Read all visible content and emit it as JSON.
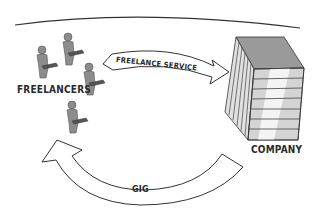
{
  "diagram": {
    "type": "flow",
    "nodes": [
      {
        "id": "freelancers",
        "label": "Freelancers",
        "display": "FREELANCERS",
        "icon": "person-with-laptop-icon",
        "count": 4
      },
      {
        "id": "company",
        "label": "Company",
        "display": "COMPANY",
        "icon": "office-building-icon"
      }
    ],
    "edges": [
      {
        "from": "freelancers",
        "to": "company",
        "label": "FREELANCE SERVICE"
      },
      {
        "from": "company",
        "to": "freelancers",
        "label": "GIG"
      }
    ]
  },
  "labels": {
    "freelancers": "FREELANCERS",
    "company": "COMPANY",
    "service": "FREELANCE SERVICE",
    "gig": "GIG"
  },
  "colors": {
    "figure": "#8c8c8c",
    "figure_dark": "#5a5a5a",
    "building_top": "#9a9a9a",
    "building_side": "#d0d0d0",
    "building_light": "#f0f0f0",
    "stroke": "#333333",
    "arrow_fill": "#ffffff"
  }
}
